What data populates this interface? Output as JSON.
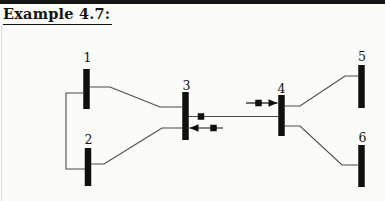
{
  "page": {
    "title": "Example 4.7:",
    "background": "#fbfbf8",
    "rule_color": "#151515",
    "edge_line_color": "#c9c9c1"
  },
  "diagram": {
    "type": "power-system-one-line",
    "ink": "#101010",
    "wire_color": "#4a4a4a",
    "bus_width": 6.5,
    "square_size": 6.5,
    "buses": [
      {
        "id": "bus-1",
        "label": "1",
        "cx": 86.5,
        "y1": 69,
        "y2": 109,
        "lx": 87.5,
        "ly": 62
      },
      {
        "id": "bus-2",
        "label": "2",
        "cx": 88,
        "y1": 148,
        "y2": 186,
        "lx": 88.5,
        "ly": 143.5
      },
      {
        "id": "bus-3",
        "label": "3",
        "cx": 185.5,
        "y1": 92,
        "y2": 140,
        "lx": 186.5,
        "ly": 89.5
      },
      {
        "id": "bus-4",
        "label": "4",
        "cx": 281.5,
        "y1": 95,
        "y2": 136,
        "lx": 281.5,
        "ly": 93
      },
      {
        "id": "bus-5",
        "label": "5",
        "cx": 361.5,
        "y1": 65,
        "y2": 108,
        "lx": 362,
        "ly": 61
      },
      {
        "id": "bus-6",
        "label": "6",
        "cx": 361.5,
        "y1": 145,
        "y2": 187,
        "lx": 362.5,
        "ly": 141.5
      }
    ],
    "connections": [
      {
        "id": "line-1-3",
        "points": [
          [
            89.8,
            87
          ],
          [
            110,
            87
          ],
          [
            160,
            107
          ],
          [
            182.2,
            107
          ]
        ]
      },
      {
        "id": "line-2-3",
        "points": [
          [
            91.2,
            164
          ],
          [
            104,
            164
          ],
          [
            162,
            128
          ],
          [
            182.2,
            128
          ]
        ]
      },
      {
        "id": "line-1-2",
        "points": [
          [
            83.2,
            93
          ],
          [
            66,
            93
          ],
          [
            66,
            169
          ],
          [
            84.8,
            169
          ]
        ]
      },
      {
        "id": "line-3-4",
        "points": [
          [
            188.8,
            116.5
          ],
          [
            278.2,
            116.5
          ]
        ]
      },
      {
        "id": "line-4-5",
        "points": [
          [
            284.8,
            106
          ],
          [
            300,
            106
          ],
          [
            345,
            76
          ],
          [
            358.2,
            76
          ]
        ]
      },
      {
        "id": "line-4-6",
        "points": [
          [
            284.8,
            126
          ],
          [
            300,
            126
          ],
          [
            342,
            165
          ],
          [
            358.2,
            165
          ]
        ]
      }
    ],
    "measurement_squares": [
      {
        "id": "measurement-square-line-3-4",
        "cx": 201,
        "cy": 116.5
      }
    ],
    "flow_arrows": [
      {
        "id": "flow-arrow-into-bus-4",
        "y": 103,
        "x_tail": 246,
        "x_tip": 277.5,
        "dir": "right",
        "square_cx": 258.5
      },
      {
        "id": "flow-arrow-into-bus-3",
        "y": 128,
        "x_tail": 223,
        "x_tip": 189.5,
        "dir": "left",
        "square_cx": 213.5
      }
    ]
  }
}
